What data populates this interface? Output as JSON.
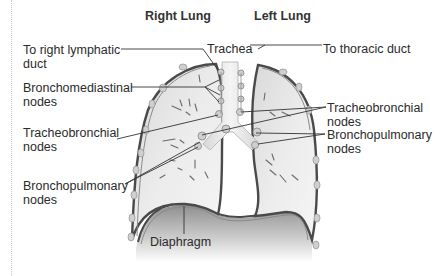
{
  "diagram": {
    "headings": {
      "right_lung": "Right Lung",
      "left_lung": "Left Lung"
    },
    "labels": {
      "to_right_lymphatic_duct": {
        "line1": "To right lymphatic",
        "line2": "duct"
      },
      "trachea": "Trachea",
      "to_thoracic_duct": "To thoracic duct",
      "bronchomediastinal_nodes": {
        "line1": "Bronchomediastinal",
        "line2": "nodes"
      },
      "tracheobronchial_nodes_left_side": {
        "line1": "Tracheobronchial",
        "line2": "nodes"
      },
      "bronchopulmonary_nodes_left_side": {
        "line1": "Bronchopulmonary",
        "line2": "nodes"
      },
      "tracheobronchial_nodes_right_side": {
        "line1": "Tracheobronchial",
        "line2": "nodes"
      },
      "bronchopulmonary_nodes_right_side": {
        "line1": "Bronchopulmonary",
        "line2": "nodes"
      },
      "diaphragm": "Diaphragm"
    },
    "colors": {
      "background": "#ffffff",
      "lung_fill": "#e6e6e6",
      "lung_outline": "#4a4a4a",
      "node_fill": "#c9c9c9",
      "trachea_fill": "#ececec",
      "diaphragm_fill": "#a9a9a9",
      "text": "#2b2b2b"
    }
  }
}
